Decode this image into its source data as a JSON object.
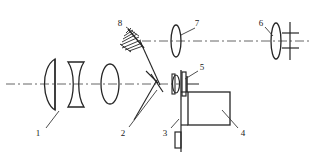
{
  "figure": {
    "kind": "optical-system-schematic",
    "title": "",
    "background_color": "#ffffff",
    "line_color": "#262626",
    "axis_color": "#555555",
    "width": 317,
    "height": 160
  },
  "axes": {
    "main_optical_axis": {
      "name": "lower-horizontal-optical-axis",
      "style": "dash-dot",
      "y": 84,
      "x_start": 6,
      "x_end": 180
    },
    "upper_optical_axis": {
      "name": "upper-horizontal-optical-axis",
      "style": "dash-dot",
      "y": 41,
      "x_start": 140,
      "x_end": 312
    }
  },
  "components": [
    {
      "id": "1",
      "name": "objective-front-lens",
      "type": "plano-convex-lens",
      "label": "1",
      "label_x": 38,
      "label_y": 133,
      "leader": {
        "x1": 46,
        "y1": 128,
        "x2": 58,
        "y2": 112
      }
    },
    {
      "id": "2",
      "name": "beamsplitter",
      "type": "beamsplitter-plate",
      "label": "2",
      "label_x": 123,
      "label_y": 133,
      "leader": {
        "x1": 128,
        "y1": 128,
        "x2": 157,
        "y2": 90
      }
    },
    {
      "id": "3",
      "name": "lower-aperture-stop",
      "type": "rectangular-stop",
      "label": "3",
      "label_x": 165,
      "label_y": 133,
      "leader": {
        "x1": 172,
        "y1": 128,
        "x2": 179,
        "y2": 119
      }
    },
    {
      "id": "4",
      "name": "detector-housing",
      "type": "rectangular-block",
      "label": "4",
      "label_x": 241,
      "label_y": 133,
      "leader": {
        "x1": 238,
        "y1": 128,
        "x2": 222,
        "y2": 110
      }
    },
    {
      "id": "5",
      "name": "field-lens-assembly",
      "type": "lens-with-mount",
      "label": "5",
      "label_x": 200,
      "label_y": 69,
      "leader": {
        "x1": 198,
        "y1": 70,
        "x2": 186,
        "y2": 78
      }
    },
    {
      "id": "6",
      "name": "eyepiece-lens",
      "type": "biconvex-lens",
      "label": "6",
      "label_x": 261,
      "label_y": 25,
      "leader": {
        "x1": 264,
        "y1": 27,
        "x2": 272,
        "y2": 36
      }
    },
    {
      "id": "7",
      "name": "collimating-lens",
      "type": "biconvex-lens",
      "label": "7",
      "label_x": 197,
      "label_y": 25,
      "leader": {
        "x1": 195,
        "y1": 27,
        "x2": 180,
        "y2": 36
      }
    },
    {
      "id": "8",
      "name": "fold-mirror",
      "type": "hatched-plane-mirror",
      "label": "8",
      "label_x": 120,
      "label_y": 25,
      "leader": {
        "x1": 126,
        "y1": 26,
        "x2": 140,
        "y2": 36
      }
    }
  ],
  "extra_elements": [
    {
      "name": "reticle-graticule",
      "type": "crosshair-reticle",
      "x": 288,
      "y": 41
    },
    {
      "name": "beam-path-mirror-to-splitter",
      "type": "solid-ray"
    },
    {
      "name": "beam-path-splitter-down-left",
      "type": "solid-ray"
    }
  ]
}
